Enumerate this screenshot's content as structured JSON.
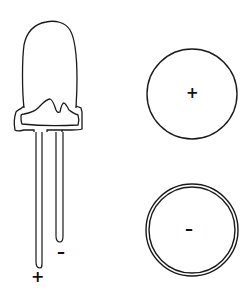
{
  "diagram": {
    "led": {
      "anode_label": "+",
      "cathode_label": "–"
    },
    "terminals": [
      {
        "name": "positive",
        "label": "+",
        "style": "single-ring"
      },
      {
        "name": "negative",
        "label": "–",
        "style": "double-ring"
      }
    ],
    "colors": {
      "stroke": "#1a1a1a",
      "background": "#ffffff"
    }
  }
}
